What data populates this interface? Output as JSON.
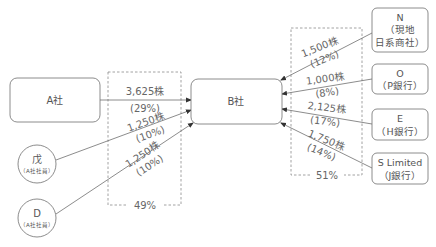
{
  "colors": {
    "stroke": "#6e6e6e",
    "dashed": "#8a8a8a",
    "text": "#555555",
    "background": "#ffffff"
  },
  "nodes": {
    "a_company": {
      "label": "A社"
    },
    "b_company": {
      "label": "B社"
    },
    "bo": {
      "name": "戊",
      "sub": "（A社社員）"
    },
    "d": {
      "name": "D",
      "sub": "（A社社員）"
    },
    "n": {
      "line1": "N",
      "line2": "（現地",
      "line3": "日系商社）"
    },
    "o": {
      "line1": "O",
      "line2": "（P銀行）"
    },
    "e": {
      "line1": "E",
      "line2": "（H銀行）"
    },
    "s": {
      "line1": "S Limited",
      "line2": "（J銀行）"
    }
  },
  "edges": {
    "a_to_b": {
      "shares": "3,625株",
      "pct": "(29%)"
    },
    "bo_to_b": {
      "shares": "1,250株",
      "pct": "(10%)"
    },
    "d_to_b": {
      "shares": "1,250株",
      "pct": "(10%)"
    },
    "n_to_b": {
      "shares": "1,500株",
      "pct": "(12%)"
    },
    "o_to_b": {
      "shares": "1,000株",
      "pct": "(8%)"
    },
    "e_to_b": {
      "shares": "2,125株",
      "pct": "(17%)"
    },
    "s_to_b": {
      "shares": "1,750株",
      "pct": "(14%)"
    }
  },
  "groups": {
    "left_total": "49%",
    "right_total": "51%"
  }
}
